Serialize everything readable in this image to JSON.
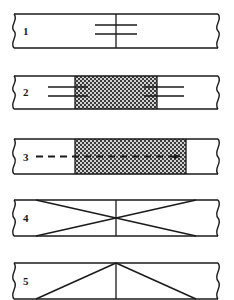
{
  "figure": {
    "colors": {
      "line": "#1a1a1a",
      "background": "#ffffff",
      "stipple_fill": "#c9c9c9",
      "stipple_dot": "#3a3a3a"
    },
    "bar": {
      "left_x": 14,
      "right_x": 218,
      "center_x": 116,
      "height": 34
    },
    "panels": [
      {
        "number": "1",
        "label": "weld-symbol-plain",
        "top": 14,
        "symbol": "two-horizontal-lines-crossing-centerline",
        "has_stipple": false,
        "has_arrow": false,
        "marks": "double horizontal lines at centerline",
        "line_count": 2
      },
      {
        "number": "2",
        "label": "weld-symbol-stippled-zone",
        "top": 75,
        "symbol": "double-lines-both-sides-of-stippled-zone",
        "has_stipple": true,
        "stipple_start": 75,
        "stipple_end": 157,
        "has_arrow": false,
        "marks": "double horizontal lines on each side of stippled region",
        "line_count": 4
      },
      {
        "number": "3",
        "label": "dashed-arrow-through-stippled-zone",
        "top": 138,
        "symbol": "dash-dot-arrow-pointing-right",
        "has_stipple": true,
        "stipple_start": 75,
        "stipple_end": 186,
        "has_arrow": true,
        "arrow_start": 36,
        "arrow_end": 183,
        "marks": "dashed line with solid arrowhead at right",
        "line_count": 1
      },
      {
        "number": "4",
        "label": "x-cross-pattern",
        "top": 200,
        "symbol": "diagonal-cross-with-centerline",
        "has_stipple": false,
        "has_arrow": false,
        "marks": "two diagonals crossing at centerline plus vertical centerline",
        "line_count": 3
      },
      {
        "number": "5",
        "label": "chevron-pattern",
        "top": 263,
        "symbol": "triangle-apex-with-centerline",
        "has_stipple": false,
        "has_arrow": false,
        "marks": "two diagonals meeting at top centre plus vertical centerline",
        "line_count": 3
      }
    ]
  }
}
